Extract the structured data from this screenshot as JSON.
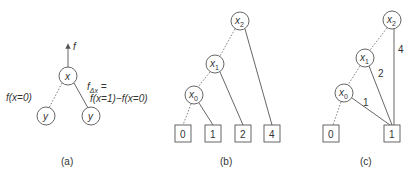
{
  "panels": [
    {
      "caption": "(a)",
      "output_arrow_label": "f",
      "root": "x",
      "children": [
        "y",
        "y"
      ],
      "low_edge_label": "f(x=0)",
      "high_edge_label_line1": "f",
      "high_edge_label_sub": "Δx",
      "high_edge_label_eq": " =",
      "high_edge_label_line2": "f(x=1)−f(x=0)"
    },
    {
      "caption": "(b)",
      "nodes": [
        {
          "name": "x",
          "sub": "2"
        },
        {
          "name": "x",
          "sub": "1"
        },
        {
          "name": "x",
          "sub": "0"
        }
      ],
      "terminals": [
        "0",
        "1",
        "2",
        "4"
      ]
    },
    {
      "caption": "(c)",
      "nodes": [
        {
          "name": "x",
          "sub": "2"
        },
        {
          "name": "x",
          "sub": "1"
        },
        {
          "name": "x",
          "sub": "0"
        }
      ],
      "terminals": [
        "0",
        "1"
      ],
      "edge_weights": [
        "4",
        "2",
        "1"
      ]
    }
  ],
  "colors": {
    "stroke": "#555555",
    "text": "#333333",
    "background": "#ffffff"
  }
}
